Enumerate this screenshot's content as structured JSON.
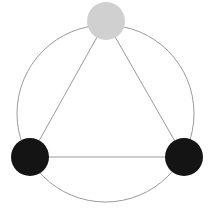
{
  "diagram": {
    "type": "triangle-in-circle",
    "background": "#ffffff",
    "outer_circle": {
      "cx": 105.5,
      "cy": 113.5,
      "r": 88.5,
      "stroke": "#9a9a9a",
      "stroke_width": 1
    },
    "edge_style": {
      "stroke": "#9a9a9a",
      "stroke_width": 1
    },
    "nodes": [
      {
        "id": "top",
        "cx": 106,
        "cy": 21,
        "r": 19,
        "fill": "#d0d0d0"
      },
      {
        "id": "bottom-left",
        "cx": 30,
        "cy": 157,
        "r": 19,
        "fill": "#141414"
      },
      {
        "id": "bottom-right",
        "cx": 184,
        "cy": 157,
        "r": 19,
        "fill": "#141414"
      }
    ],
    "edges": [
      {
        "from": "top",
        "to": "bottom-left"
      },
      {
        "from": "top",
        "to": "bottom-right"
      },
      {
        "from": "bottom-left",
        "to": "bottom-right"
      }
    ]
  }
}
